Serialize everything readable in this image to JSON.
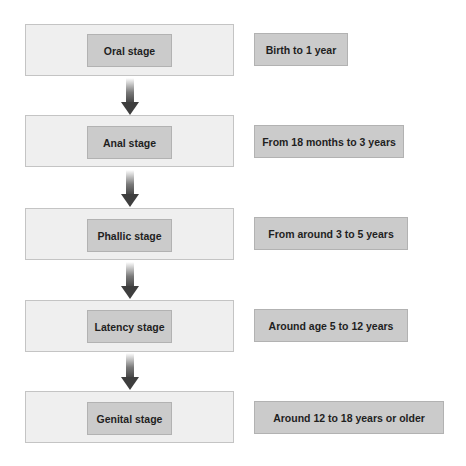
{
  "diagram": {
    "type": "flowchart",
    "direction": "top-to-bottom",
    "stages": [
      {
        "label": "Oral stage",
        "age": "Birth to 1 year"
      },
      {
        "label": "Anal stage",
        "age": "From 18 months to 3 years"
      },
      {
        "label": "Phallic stage",
        "age": "From around 3 to 5 years"
      },
      {
        "label": "Latency stage",
        "age": "Around age 5 to 12 years"
      },
      {
        "label": "Genital stage",
        "age": "Around 12 to 18 years or older"
      }
    ],
    "colors": {
      "outer_box": "#efefef",
      "inner_box": "#cbcbcb",
      "arrow": "#4a4a4a",
      "text": "#1f1f1f"
    }
  }
}
